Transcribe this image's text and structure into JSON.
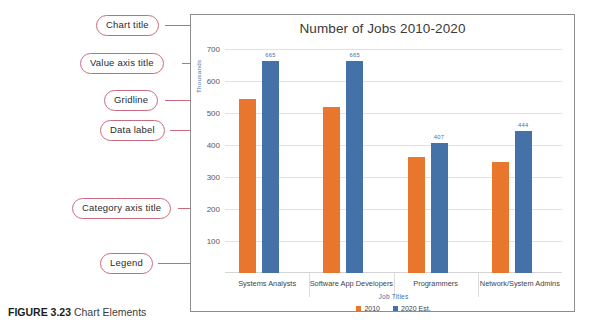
{
  "figure": {
    "caption_label": "FIGURE 3.23",
    "caption_text": " Chart Elements"
  },
  "callouts": [
    {
      "name": "chart-title",
      "label": "Chart title"
    },
    {
      "name": "value-axis-title",
      "label": "Value axis title"
    },
    {
      "name": "gridline",
      "label": "Gridline"
    },
    {
      "name": "data-label",
      "label": "Data label"
    },
    {
      "name": "category-axis-title",
      "label": "Category axis title"
    },
    {
      "name": "legend",
      "label": "Legend"
    }
  ],
  "chart_data": {
    "type": "bar",
    "title": "Number of Jobs 2010-2020",
    "xlabel": "Job Titles",
    "ylabel": "Thousands",
    "ylim": [
      0,
      720
    ],
    "yticks": [
      700,
      600,
      500,
      400,
      300,
      200,
      100
    ],
    "grid": true,
    "legend_position": "bottom",
    "categories": [
      "Systems Analysts",
      "Software App Developers",
      "Programmers",
      "Network/System Admins"
    ],
    "series": [
      {
        "name": "2010",
        "color": "#e8762c",
        "values": [
          545,
          521,
          364,
          347
        ],
        "data_labels": [
          "",
          "",
          "",
          ""
        ]
      },
      {
        "name": "2020 Est.",
        "color": "#4472a8",
        "values": [
          665,
          665,
          407,
          444
        ],
        "data_labels": [
          "665",
          "665",
          "407",
          "444"
        ]
      }
    ]
  }
}
